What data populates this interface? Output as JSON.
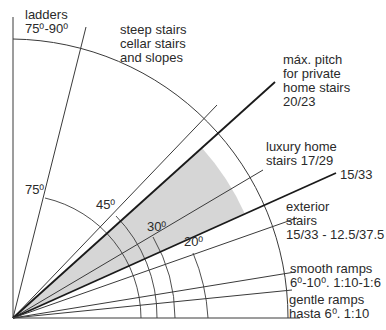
{
  "diagram": {
    "colors": {
      "line": "#3a3a3a",
      "bold_line": "#1a1a1a",
      "shade": "#d6d6d6",
      "text": "#2a2a2a"
    },
    "labels": {
      "ladders": {
        "line1": "ladders",
        "line2": "75⁰-90⁰"
      },
      "steep": {
        "line1": "steep stairs",
        "line2": "cellar stairs",
        "line3": "and slopes"
      },
      "max_pitch": {
        "line1": "máx. pitch",
        "line2": "for private",
        "line3": "home stairs",
        "line4": "20/23"
      },
      "luxury": {
        "line1": "luxury home",
        "line2": "stairs 17/29"
      },
      "ratio_15_33": "15/33",
      "exterior": {
        "line1": "exterior",
        "line2": "stairs",
        "line3": "15/33 - 12.5/37.5"
      },
      "smooth_ramps": {
        "line1": "smooth ramps",
        "line2": "6⁰-10⁰. 1:10-1:6"
      },
      "gentle_ramps": {
        "line1": "gentle ramps",
        "line2": "hasta 6⁰. 1:10"
      }
    },
    "angle_marks": {
      "a75": "75⁰",
      "a45": "45⁰",
      "a30": "30⁰",
      "a20": "20⁰"
    }
  }
}
